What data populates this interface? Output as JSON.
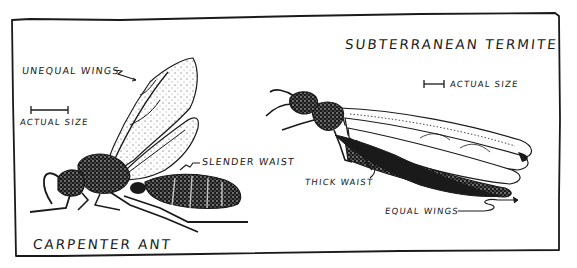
{
  "figure": {
    "frame": {
      "stroke_color": "#1a1a1a",
      "background": "#ffffff"
    },
    "left_panel": {
      "title": "CARPENTER ANT",
      "scale_label": "ACTUAL SIZE",
      "callouts": [
        {
          "id": "unequal-wings",
          "text": "UNEQUAL WINGS"
        },
        {
          "id": "slender-waist",
          "text": "SLENDER WAIST"
        }
      ]
    },
    "right_panel": {
      "title": "SUBTERRANEAN TERMITE",
      "scale_label": "ACTUAL SIZE",
      "callouts": [
        {
          "id": "thick-waist",
          "text": "THICK WAIST"
        },
        {
          "id": "equal-wings",
          "text": "EQUAL WINGS"
        }
      ]
    },
    "ink_color": "#1a1a1a"
  }
}
